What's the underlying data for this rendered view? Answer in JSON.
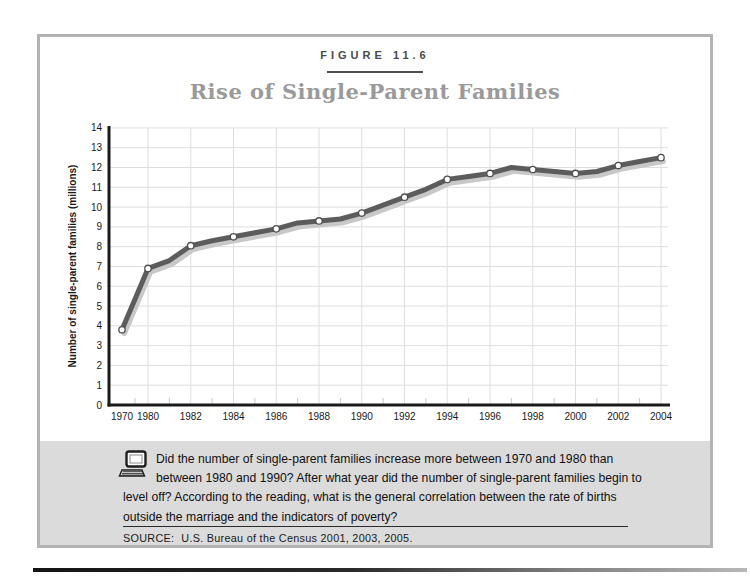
{
  "figure": {
    "label": "FIGURE 11.6",
    "title": "Rise of Single-Parent Families"
  },
  "chart_data": {
    "type": "line",
    "title": "Rise of Single-Parent Families",
    "xlabel": "",
    "ylabel": "Number of single-parent families (millions)",
    "ylim": [
      0,
      14
    ],
    "ytick_step": 1,
    "grid": true,
    "legend": "none",
    "x_ticks": [
      1970,
      1980,
      1982,
      1984,
      1986,
      1988,
      1990,
      1992,
      1994,
      1996,
      1998,
      2000,
      2002,
      2004
    ],
    "x_axis_note": "1970 is compressed next to 1980; even years evenly spaced thereafter",
    "series": [
      {
        "name": "Number of single-parent families (millions)",
        "points": [
          {
            "year": 1970,
            "value": 3.8,
            "marker": true
          },
          {
            "year": 1980,
            "value": 6.9,
            "marker": true
          },
          {
            "year": 1981,
            "value": 7.3,
            "marker": false
          },
          {
            "year": 1982,
            "value": 8.05,
            "marker": true
          },
          {
            "year": 1983,
            "value": 8.3,
            "marker": false
          },
          {
            "year": 1984,
            "value": 8.5,
            "marker": true
          },
          {
            "year": 1985,
            "value": 8.7,
            "marker": false
          },
          {
            "year": 1986,
            "value": 8.9,
            "marker": true
          },
          {
            "year": 1987,
            "value": 9.2,
            "marker": false
          },
          {
            "year": 1988,
            "value": 9.3,
            "marker": true
          },
          {
            "year": 1989,
            "value": 9.4,
            "marker": false
          },
          {
            "year": 1990,
            "value": 9.7,
            "marker": true
          },
          {
            "year": 1991,
            "value": 10.1,
            "marker": false
          },
          {
            "year": 1992,
            "value": 10.5,
            "marker": true
          },
          {
            "year": 1993,
            "value": 10.9,
            "marker": false
          },
          {
            "year": 1994,
            "value": 11.4,
            "marker": true
          },
          {
            "year": 1995,
            "value": 11.55,
            "marker": false
          },
          {
            "year": 1996,
            "value": 11.7,
            "marker": true
          },
          {
            "year": 1997,
            "value": 12.0,
            "marker": false
          },
          {
            "year": 1998,
            "value": 11.9,
            "marker": true
          },
          {
            "year": 1999,
            "value": 11.8,
            "marker": false
          },
          {
            "year": 2000,
            "value": 11.7,
            "marker": true
          },
          {
            "year": 2001,
            "value": 11.8,
            "marker": false
          },
          {
            "year": 2002,
            "value": 12.1,
            "marker": true
          },
          {
            "year": 2003,
            "value": 12.3,
            "marker": false
          },
          {
            "year": 2004,
            "value": 12.5,
            "marker": true
          }
        ]
      }
    ]
  },
  "panel": {
    "icon": "computer-icon",
    "question_lines": [
      "Did the number of single-parent families increase more between 1970 and 1980 than",
      "between 1980 and 1990? After what year did the number of single-parent families begin to",
      "level off? According to the reading, what is the general correlation between the rate of births",
      "outside the marriage and the indicators of poverty?"
    ],
    "source_label": "SOURCE:",
    "source_text": "U.S. Bureau of the Census 2001, 2003, 2005."
  },
  "colors": {
    "box_border": "#b3b3b3",
    "panel_bg": "#dbdbdb",
    "figure_label": "#4a4a4a",
    "title": "#9a9a9a",
    "axis": "#1a1a1a",
    "text": "#1a1a1a",
    "grid": "#dedede",
    "minor_tick": "#c9c9c9",
    "line": "#5c5c5c",
    "line_shadow": "#c8c8c8",
    "marker_fill": "#ffffff",
    "marker_stroke": "#4f4f4f"
  }
}
